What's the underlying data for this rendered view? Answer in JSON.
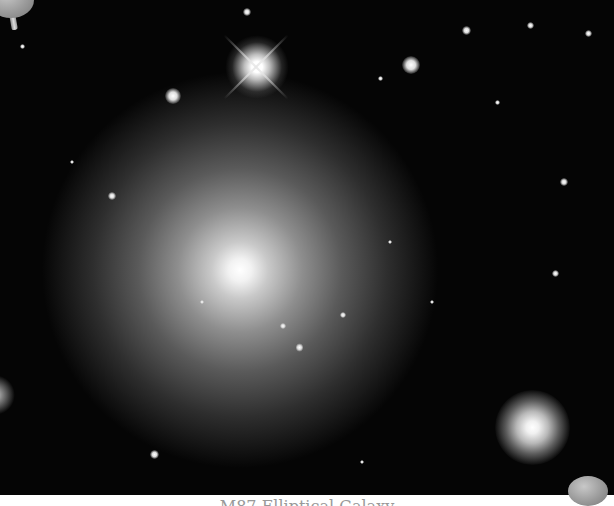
{
  "image": {
    "subject": "elliptical galaxy in a star field",
    "colors": {
      "background": "#050505",
      "frame": "#ffffff",
      "glow": "#ffffff"
    }
  },
  "caption": {
    "text": "M87 Elliptical Galaxy"
  },
  "decorations": [
    {
      "name": "pushpin",
      "position": "top-left"
    },
    {
      "name": "pushpin",
      "position": "bottom-right"
    }
  ]
}
